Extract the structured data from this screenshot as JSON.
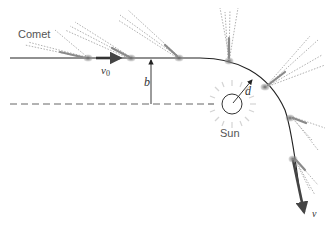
{
  "diagram": {
    "labels": {
      "comet": "Comet",
      "sun": "Sun",
      "initial_velocity_symbol": "v",
      "initial_velocity_subscript": "0",
      "impact_parameter": "b",
      "closest_approach": "d",
      "final_velocity": "v"
    },
    "colors": {
      "path": "#222222",
      "dashed_line": "#666666",
      "comet_head": "#777777",
      "comet_tail": "#aaaaaa",
      "sun_rays": "#cccccc",
      "text": "#555555"
    },
    "comet_positions": [
      {
        "x": 88,
        "y": 58,
        "tail_dir": "left"
      },
      {
        "x": 131,
        "y": 58,
        "tail_dir": "upper-left"
      },
      {
        "x": 179,
        "y": 58,
        "tail_dir": "upper-left"
      },
      {
        "x": 229,
        "y": 61,
        "tail_dir": "up"
      },
      {
        "x": 265,
        "y": 87,
        "tail_dir": "upper-right"
      },
      {
        "x": 290,
        "y": 118,
        "tail_dir": "right"
      },
      {
        "x": 293,
        "y": 159,
        "tail_dir": "lower-right"
      }
    ]
  }
}
